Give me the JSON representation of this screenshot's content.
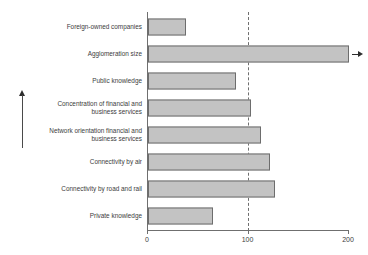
{
  "chart_data": {
    "type": "bar",
    "orientation": "horizontal",
    "title": "",
    "xlabel": "",
    "ylabel": "",
    "xlim": [
      0,
      200
    ],
    "xticks": [
      0,
      100,
      200
    ],
    "xtick_labels": [
      "0",
      "100",
      "200"
    ],
    "grid": false,
    "legend": null,
    "reference_line": {
      "value": 100,
      "style": "dashed",
      "color": "#6f6f6f"
    },
    "bar_style": {
      "fill": "#c3c3c3",
      "edge": "#6d6d6d"
    },
    "categories": [
      "Foreign-owned companies",
      "Agglomeration size",
      "Public knowledge",
      "Concentration of financial and\nbusiness services",
      "Network orientation financial and\nbusiness services",
      "Connectivity by air",
      "Connectivity by road and rail",
      "Private knowledge"
    ],
    "values": [
      38,
      200,
      88,
      102,
      112,
      121,
      126,
      65
    ],
    "annotations": [
      {
        "name": "overflow-arrow",
        "category": "Agglomeration size",
        "note": "bar truncated at axis maximum; arrow indicates value extends beyond 200"
      },
      {
        "name": "direction-arrow",
        "note": "vertical upward arrow at left margin"
      }
    ]
  }
}
